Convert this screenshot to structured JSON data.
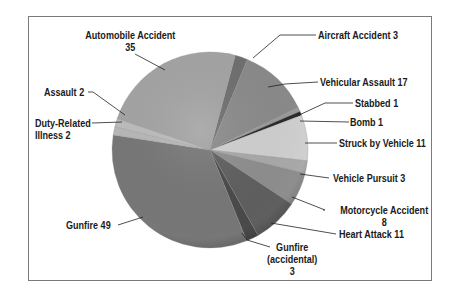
{
  "chart_data": {
    "type": "pie",
    "title": "",
    "total": 146,
    "start_angle_deg": -16,
    "slices": [
      {
        "label": "Aircraft Accident",
        "value": 3,
        "color": "#6f6f6f"
      },
      {
        "label": "Vehicular Assault",
        "value": 17,
        "color": "#8a8a8a"
      },
      {
        "label": "Stabbed",
        "value": 1,
        "color": "#9a9a9a"
      },
      {
        "label": "Bomb",
        "value": 1,
        "color": "#2a2a2a"
      },
      {
        "label": "Struck by Vehicle",
        "value": 11,
        "color": "#cfcfcf"
      },
      {
        "label": "Vehicle Pursuit",
        "value": 3,
        "color": "#a9a9a9"
      },
      {
        "label": "Motorcycle Accident",
        "value": 8,
        "color": "#8e8e8e"
      },
      {
        "label": "Heart Attack",
        "value": 11,
        "color": "#5f5f5f"
      },
      {
        "label": "Gunfire (accidental)",
        "value": 3,
        "color": "#4a4a4a"
      },
      {
        "label": "Gunfire",
        "value": 49,
        "color": "#777777"
      },
      {
        "label": "Duty-Related Illness",
        "value": 2,
        "color": "#b8b8b8"
      },
      {
        "label": "Assault",
        "value": 2,
        "color": "#bdbdbd"
      },
      {
        "label": "Automobile Accident",
        "value": 35,
        "color": "#a4a4a4"
      }
    ],
    "legend": "none (leader-line callouts)"
  },
  "labels": {
    "automobile_accident": [
      "Automobile Accident",
      "35"
    ],
    "aircraft_accident": "Aircraft Accident 3",
    "vehicular_assault": "Vehicular Assault 17",
    "stabbed": "Stabbed 1",
    "bomb": "Bomb 1",
    "struck_by_vehicle": "Struck by Vehicle 11",
    "vehicle_pursuit": "Vehicle Pursuit 3",
    "motorcycle_accident": [
      "Motorcycle Accident",
      "8"
    ],
    "heart_attack": "Heart Attack 11",
    "gunfire_accidental": [
      "Gunfire",
      "(accidental)",
      "3"
    ],
    "gunfire": "Gunfire 49",
    "assault": "Assault 2",
    "duty_related_illness": [
      "Duty-Related",
      "Illness 2"
    ]
  }
}
